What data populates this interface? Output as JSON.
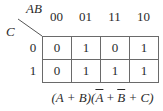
{
  "kmap": {
    "row_variable": "C",
    "column_variables": "AB",
    "column_headers": [
      "00",
      "01",
      "11",
      "10"
    ],
    "row_headers": [
      "0",
      "1"
    ],
    "cells": [
      [
        "0",
        "1",
        "0",
        "1"
      ],
      [
        "0",
        "1",
        "1",
        "1"
      ]
    ]
  },
  "expression": {
    "part1": "(A + B)(",
    "abar": "A",
    "plus1": " + ",
    "bbar": "B",
    "part2": " + C)"
  }
}
